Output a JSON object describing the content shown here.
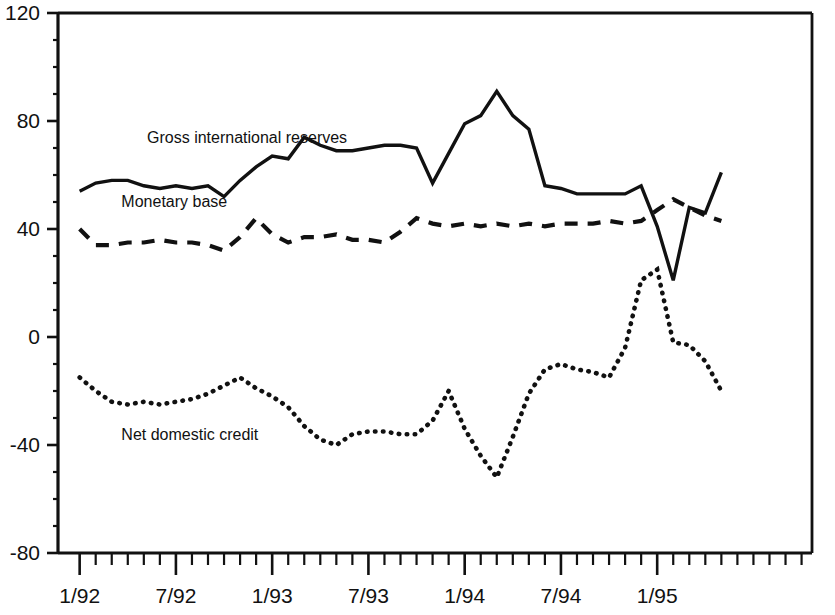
{
  "chart_data": {
    "type": "line",
    "title": "",
    "subtitle": "",
    "xlabel": "",
    "ylabel": "",
    "ylim": [
      -80,
      120
    ],
    "y_ticks": [
      -80,
      -40,
      0,
      40,
      80,
      120
    ],
    "y_tick_labels": [
      "-80",
      "-40",
      "0",
      "40",
      "80",
      "120"
    ],
    "x_tick_labels": [
      "1/92",
      "7/92",
      "1/93",
      "7/93",
      "1/94",
      "7/94",
      "1/95"
    ],
    "x_tick_label_indices": [
      0,
      6,
      12,
      18,
      24,
      30,
      36
    ],
    "x_minor_ticks_count": 46,
    "grid": false,
    "legend_position": "inline-annotations",
    "x": [
      "1/92",
      "2/92",
      "3/92",
      "4/92",
      "5/92",
      "6/92",
      "7/92",
      "8/92",
      "9/92",
      "10/92",
      "11/92",
      "12/92",
      "1/93",
      "2/93",
      "3/93",
      "4/93",
      "5/93",
      "6/93",
      "7/93",
      "8/93",
      "9/93",
      "10/93",
      "11/93",
      "12/93",
      "1/94",
      "2/94",
      "3/94",
      "4/94",
      "5/94",
      "6/94",
      "7/94",
      "8/94",
      "9/94",
      "10/94",
      "11/94",
      "12/94",
      "1/95",
      "2/95",
      "3/95",
      "4/95",
      "5/95"
    ],
    "series": [
      {
        "name": "Gross international reserves",
        "style": "solid",
        "label_x_value": 4.2,
        "label_y_value": 72,
        "values": [
          54,
          57,
          58,
          58,
          56,
          55,
          56,
          55,
          56,
          52,
          58,
          63,
          67,
          66,
          74,
          71,
          69,
          69,
          70,
          71,
          71,
          70,
          57,
          68,
          79,
          82,
          91,
          82,
          77,
          56,
          55,
          53,
          53,
          53,
          53,
          56,
          41,
          21,
          48,
          46,
          61
        ]
      },
      {
        "name": "Monetary base",
        "style": "dashed",
        "label_x_value": 2.6,
        "label_y_value": 48,
        "values": [
          40,
          34,
          34,
          35,
          35,
          36,
          35,
          35,
          34,
          32,
          37,
          44,
          38,
          35,
          37,
          37,
          38,
          36,
          36,
          35,
          39,
          44,
          42,
          41,
          42,
          41,
          42,
          41,
          42,
          41,
          42,
          42,
          42,
          43,
          42,
          43,
          47,
          51,
          48,
          45,
          43
        ]
      },
      {
        "name": "Net domestic credit",
        "style": "dotted",
        "label_x_value": 2.6,
        "label_y_value": -38,
        "values": [
          -15,
          -20,
          -24,
          -25,
          -24,
          -25,
          -24,
          -23,
          -21,
          -18,
          -15,
          -19,
          -22,
          -26,
          -33,
          -38,
          -40,
          -36,
          -35,
          -35,
          -36,
          -36,
          -31,
          -20,
          -34,
          -44,
          -52,
          -37,
          -21,
          -12,
          -10,
          -12,
          -13,
          -15,
          -4,
          21,
          25,
          -2,
          -3,
          -9,
          -20
        ]
      }
    ]
  }
}
